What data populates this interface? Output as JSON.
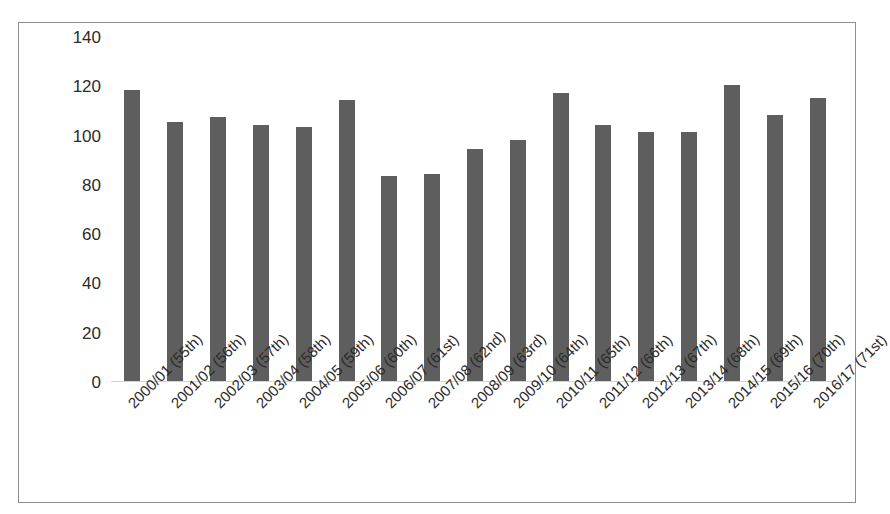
{
  "chart_data": {
    "type": "bar",
    "title": "",
    "subtitle": "",
    "xlabel": "",
    "ylabel": "",
    "ylim": [
      0,
      140
    ],
    "y_ticks": [
      0,
      20,
      40,
      60,
      80,
      100,
      120,
      140
    ],
    "grid": false,
    "legend": null,
    "bar_color": "#5e5e5e",
    "categories": [
      "2000/01 (55th)",
      "2001/02 (56th)",
      "2002/03 (57th)",
      "2003/04 (58th)",
      "2004/05 (59th)",
      "2005/06 (60th)",
      "2006/07 (61st)",
      "2007/08 (62nd)",
      "2008/09 (63rd)",
      "2009/10 (64th)",
      "2010/11 (65th)",
      "2011/12 (66th)",
      "2012/13 (67th)",
      "2013/14 (68th)",
      "2014/15 (69th)",
      "2015/16 (70th)",
      "2016/17 (71st)"
    ],
    "values": [
      118,
      105,
      107,
      104,
      103,
      114,
      83,
      84,
      94,
      98,
      117,
      104,
      101,
      101,
      120,
      108,
      115
    ]
  },
  "frame": {
    "border_color": "#8e8e8e",
    "background": "#ffffff"
  },
  "axis": {
    "baseline_color": "#d4d4d4"
  }
}
